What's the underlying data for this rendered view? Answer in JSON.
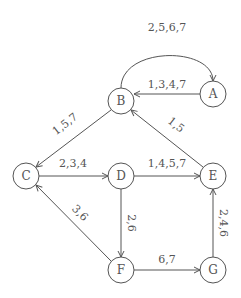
{
  "diagram": {
    "type": "directed-graph",
    "nodes": [
      {
        "id": "A",
        "label": "A",
        "x": 213,
        "y": 94
      },
      {
        "id": "B",
        "label": "B",
        "x": 121,
        "y": 101
      },
      {
        "id": "C",
        "label": "C",
        "x": 26,
        "y": 176
      },
      {
        "id": "D",
        "label": "D",
        "x": 121,
        "y": 176
      },
      {
        "id": "E",
        "label": "E",
        "x": 213,
        "y": 176
      },
      {
        "id": "F",
        "label": "F",
        "x": 121,
        "y": 270
      },
      {
        "id": "G",
        "label": "G",
        "x": 213,
        "y": 270
      }
    ],
    "edges": [
      {
        "from": "B",
        "to": "A",
        "label": "2,5,6,7",
        "curved": true
      },
      {
        "from": "A",
        "to": "B",
        "label": "1,3,4,7"
      },
      {
        "from": "B",
        "to": "C",
        "label": "1,5,7"
      },
      {
        "from": "E",
        "to": "B",
        "label": "1,5"
      },
      {
        "from": "C",
        "to": "D",
        "label": "2,3,4"
      },
      {
        "from": "D",
        "to": "E",
        "label": "1,4,5,7"
      },
      {
        "from": "D",
        "to": "F",
        "label": "2,6"
      },
      {
        "from": "F",
        "to": "C",
        "label": "3,6"
      },
      {
        "from": "F",
        "to": "G",
        "label": "6,7"
      },
      {
        "from": "G",
        "to": "E",
        "label": "2,4,6"
      }
    ]
  }
}
